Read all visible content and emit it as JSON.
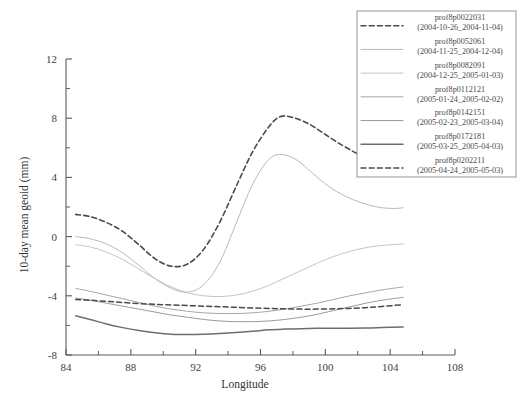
{
  "chart_data": {
    "type": "line",
    "title": "",
    "xlabel": "Longitude",
    "ylabel": "10-day mean geoid (mm)",
    "xlim": [
      84,
      108
    ],
    "ylim": [
      -8,
      12
    ],
    "xticks": [
      84,
      88,
      92,
      96,
      100,
      104,
      108
    ],
    "xtick_labels": [
      "84",
      "88",
      "92",
      "96",
      "100",
      "104",
      "108"
    ],
    "yticks": [
      -8,
      -4,
      0,
      4,
      8,
      12
    ],
    "ytick_labels": [
      "-8",
      "-4",
      "0",
      "4",
      "8",
      "12"
    ],
    "xminor_step": 2,
    "yminor_step": 2,
    "grid": false,
    "legend_position": "top-right",
    "series": [
      {
        "name": "prof8p0022031",
        "period": "(2004-10-26_2004-11-04)",
        "style": "dashed",
        "color": "#4a4a4a",
        "width": 1.6,
        "x": [
          84.6,
          85.5,
          86.5,
          87.5,
          88.5,
          89.5,
          90.5,
          91.5,
          92.5,
          93.5,
          94.5,
          95.5,
          96.5,
          97.2,
          98.0,
          99.0,
          100.0,
          101.0,
          102.0,
          103.0,
          104.0,
          104.8
        ],
        "y": [
          1.5,
          1.35,
          0.95,
          0.35,
          -0.55,
          -1.5,
          -2.0,
          -1.85,
          -0.85,
          1.0,
          3.4,
          5.7,
          7.4,
          8.1,
          8.05,
          7.6,
          6.9,
          6.2,
          5.6,
          5.2,
          4.95,
          4.85
        ]
      },
      {
        "name": "prof8p0052061",
        "period": "(2004-11-25_2004-12-04)",
        "style": "solid",
        "color": "#b9b9b9",
        "width": 1.0,
        "x": [
          84.6,
          85.5,
          86.5,
          87.5,
          88.5,
          89.5,
          90.5,
          91.5,
          92.5,
          93.5,
          94.5,
          95.5,
          96.5,
          97.3,
          98.2,
          99.2,
          100.2,
          101.2,
          102.2,
          103.2,
          104.2,
          104.8
        ],
        "y": [
          0.0,
          -0.15,
          -0.5,
          -1.1,
          -1.95,
          -2.85,
          -3.5,
          -3.75,
          -3.25,
          -1.7,
          0.9,
          3.5,
          5.2,
          5.55,
          5.2,
          4.3,
          3.4,
          2.75,
          2.3,
          2.0,
          1.9,
          1.95
        ]
      },
      {
        "name": "prof8p0082091",
        "period": "(2004-12-25_2005-01-03)",
        "style": "solid",
        "color": "#c4c4c4",
        "width": 1.0,
        "x": [
          84.6,
          85.5,
          86.5,
          87.5,
          88.5,
          89.5,
          90.5,
          91.5,
          92.5,
          93.5,
          94.5,
          95.5,
          96.5,
          97.5,
          98.5,
          99.5,
          100.5,
          101.5,
          102.5,
          103.5,
          104.8
        ],
        "y": [
          -0.55,
          -0.7,
          -1.05,
          -1.55,
          -2.2,
          -2.85,
          -3.4,
          -3.8,
          -4.0,
          -4.05,
          -3.95,
          -3.7,
          -3.3,
          -2.8,
          -2.3,
          -1.8,
          -1.35,
          -1.0,
          -0.75,
          -0.6,
          -0.5
        ]
      },
      {
        "name": "prof8p0112121",
        "period": "(2005-01-24_2005-02-02)",
        "style": "solid",
        "color": "#a6a6a6",
        "width": 1.0,
        "x": [
          84.6,
          85.5,
          86.5,
          87.5,
          88.5,
          89.5,
          90.5,
          91.5,
          92.5,
          93.5,
          94.5,
          95.5,
          96.5,
          97.5,
          98.5,
          99.5,
          100.5,
          101.5,
          102.5,
          103.5,
          104.8
        ],
        "y": [
          -3.5,
          -3.7,
          -3.95,
          -4.2,
          -4.45,
          -4.7,
          -4.9,
          -5.05,
          -5.15,
          -5.2,
          -5.2,
          -5.15,
          -5.05,
          -4.9,
          -4.7,
          -4.5,
          -4.25,
          -4.0,
          -3.8,
          -3.6,
          -3.4
        ]
      },
      {
        "name": "prof8p0142151",
        "period": "(2005-02-23_2005-03-04)",
        "style": "solid",
        "color": "#9b9b9b",
        "width": 1.0,
        "x": [
          84.6,
          85.5,
          86.5,
          87.5,
          88.5,
          89.5,
          90.5,
          91.5,
          92.5,
          93.5,
          94.5,
          95.5,
          96.5,
          97.5,
          98.5,
          99.5,
          100.5,
          101.5,
          102.5,
          103.5,
          104.8
        ],
        "y": [
          -4.15,
          -4.3,
          -4.5,
          -4.7,
          -4.9,
          -5.1,
          -5.3,
          -5.45,
          -5.6,
          -5.7,
          -5.75,
          -5.75,
          -5.7,
          -5.6,
          -5.45,
          -5.25,
          -5.0,
          -4.75,
          -4.5,
          -4.3,
          -4.1
        ]
      },
      {
        "name": "prof8p0172181",
        "period": "(2005-03-25_2005-04-03)",
        "style": "solid",
        "color": "#6e6e6e",
        "width": 1.5,
        "x": [
          84.6,
          85.5,
          86.5,
          87.5,
          88.5,
          89.5,
          90.5,
          91.5,
          92.5,
          93.5,
          94.5,
          95.5,
          96.5,
          97.5,
          98.5,
          99.5,
          100.5,
          101.5,
          102.5,
          103.5,
          104.8
        ],
        "y": [
          -5.35,
          -5.6,
          -5.9,
          -6.15,
          -6.35,
          -6.5,
          -6.6,
          -6.62,
          -6.6,
          -6.55,
          -6.48,
          -6.4,
          -6.3,
          -6.25,
          -6.22,
          -6.2,
          -6.2,
          -6.2,
          -6.18,
          -6.15,
          -6.1
        ]
      },
      {
        "name": "prof8p0202211",
        "period": "(2005-04-24_2005-05-03)",
        "style": "dashed",
        "color": "#4a4a4a",
        "width": 1.5,
        "x": [
          84.6,
          85.5,
          86.5,
          87.5,
          88.5,
          89.5,
          90.5,
          91.5,
          92.5,
          93.5,
          94.5,
          95.5,
          96.5,
          97.5,
          98.5,
          99.5,
          100.5,
          101.5,
          102.5,
          103.5,
          104.8
        ],
        "y": [
          -4.25,
          -4.3,
          -4.38,
          -4.45,
          -4.52,
          -4.58,
          -4.62,
          -4.66,
          -4.7,
          -4.74,
          -4.78,
          -4.82,
          -4.85,
          -4.88,
          -4.9,
          -4.9,
          -4.88,
          -4.85,
          -4.8,
          -4.72,
          -4.6
        ]
      }
    ]
  },
  "legend": {
    "entries": [
      {
        "name": "prof8p0022031",
        "period": "(2004-10-26_2004-11-04)"
      },
      {
        "name": "prof8p0052061",
        "period": "(2004-11-25_2004-12-04)"
      },
      {
        "name": "prof8p0082091",
        "period": "(2004-12-25_2005-01-03)"
      },
      {
        "name": "prof8p0112121",
        "period": "(2005-01-24_2005-02-02)"
      },
      {
        "name": "prof8p0142151",
        "period": "(2005-02-23_2005-03-04)"
      },
      {
        "name": "prof8p0172181",
        "period": "(2005-03-25_2005-04-03)"
      },
      {
        "name": "prof8p0202211",
        "period": "(2005-04-24_2005-05-03)"
      }
    ]
  },
  "colors": {
    "axis": "#5a5a5a",
    "text": "#3f3f3f",
    "background": "#ffffff",
    "legend_border": "#8a8a8a"
  }
}
